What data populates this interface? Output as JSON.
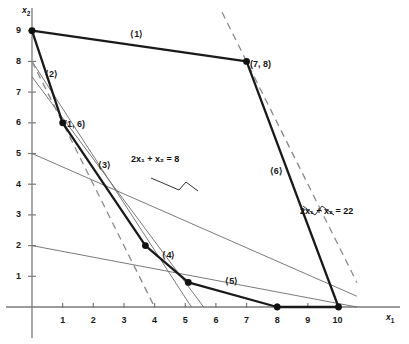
{
  "figure": {
    "type": "linear-programming-feasible-region",
    "axis_x_name": "x",
    "axis_x_sub": "1",
    "axis_y_name": "x",
    "axis_y_sub": "2"
  },
  "axes": {
    "x_ticks": [
      "1",
      "2",
      "3",
      "4",
      "5",
      "6",
      "7",
      "8",
      "9",
      "10"
    ],
    "x_tick_values": [
      1,
      2,
      3,
      4,
      5,
      6,
      7,
      8,
      9,
      10
    ],
    "y_ticks": [
      "1",
      "2",
      "3",
      "4",
      "5",
      "6",
      "7",
      "8",
      "9"
    ],
    "y_tick_values": [
      1,
      2,
      3,
      4,
      5,
      6,
      7,
      8,
      9
    ],
    "xlim": [
      0,
      10.6
    ],
    "ylim": [
      0,
      9.6
    ]
  },
  "chart_data": {
    "type": "line",
    "title": "",
    "xlabel": "x1",
    "ylabel": "x2",
    "xlim": [
      0,
      10.6
    ],
    "ylim": [
      0,
      9.6
    ],
    "grid": false,
    "legend": "none",
    "polygon_vertices": [
      {
        "x": 0,
        "y": 9,
        "label": ""
      },
      {
        "x": 7,
        "y": 8,
        "label": "(7, 8)"
      },
      {
        "x": 10,
        "y": 0,
        "label": ""
      },
      {
        "x": 8,
        "y": 0,
        "label": ""
      },
      {
        "x": 5.1,
        "y": 0.8,
        "label": ""
      },
      {
        "x": 3.7,
        "y": 2.0,
        "label": ""
      },
      {
        "x": 1,
        "y": 6,
        "label": "(1, 6)"
      }
    ],
    "edge_labels": [
      {
        "name": "edge-1",
        "text": "⟨1⟩",
        "x": 3.5,
        "y": 8.85
      },
      {
        "name": "edge-2",
        "text": "⟨2⟩",
        "x": 0.72,
        "y": 7.55
      },
      {
        "name": "edge-3",
        "text": "⟨3⟩",
        "x": 2.45,
        "y": 4.6
      },
      {
        "name": "edge-4",
        "text": "⟨4⟩",
        "x": 4.55,
        "y": 1.65
      },
      {
        "name": "edge-5",
        "text": "⟨5⟩",
        "x": 6.6,
        "y": 0.82
      },
      {
        "name": "edge-6",
        "text": "⟨6⟩",
        "x": 8.05,
        "y": 4.4
      }
    ],
    "objective_lines": [
      {
        "name": "objective-8",
        "equation": "2x1 + x2 = 8",
        "label": "2x₁ + x₂ = 8",
        "from": {
          "x": 0,
          "y": 8
        },
        "to": {
          "x": 4,
          "y": 0
        },
        "style": "dashed"
      },
      {
        "name": "objective-22",
        "equation": "2x1 + x2 = 22",
        "label": "2x₁ + x₂ = 22",
        "from": {
          "x": 6.2,
          "y": 9.6
        },
        "to": {
          "x": 10.6,
          "y": 0.8
        },
        "style": "dashed"
      }
    ],
    "constraint_lines": [
      {
        "name": "constraint-a",
        "from": {
          "x": 0,
          "y": 8
        },
        "to": {
          "x": 5.2,
          "y": 0
        }
      },
      {
        "name": "constraint-b",
        "from": {
          "x": 0,
          "y": 7.5
        },
        "to": {
          "x": 5.6,
          "y": 0
        }
      },
      {
        "name": "constraint-c",
        "from": {
          "x": 0,
          "y": 5
        },
        "to": {
          "x": 10.6,
          "y": 0.35
        }
      },
      {
        "name": "constraint-d",
        "from": {
          "x": 0,
          "y": 2
        },
        "to": {
          "x": 10.6,
          "y": 0.0
        }
      }
    ]
  },
  "annotations": {
    "point_label_1_6": "(1, 6)",
    "point_label_7_8": "(7, 8)",
    "eq_left_prefix": "2",
    "eq_left": "2x₁ + x₂ = 8",
    "eq_right": "2x₁ + x₂ = 22",
    "label_1": "⟨1⟩",
    "label_2": "⟨2⟩",
    "label_3": "⟨3⟩",
    "label_4": "⟨4⟩",
    "label_5": "⟨5⟩",
    "label_6": "⟨6⟩"
  },
  "colors": {
    "axis": "#7a7a7a",
    "polygon_edge": "#1a1a1a",
    "thin_line": "#6b6b6b",
    "dashed": "#8a8a8a",
    "text": "#111111",
    "background": "#ffffff"
  }
}
